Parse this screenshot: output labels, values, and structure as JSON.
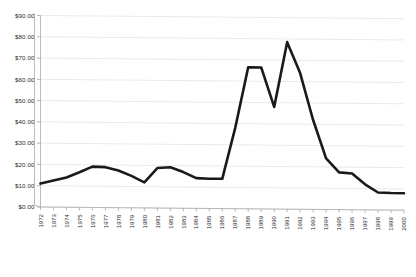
{
  "chart_data": {
    "type": "line",
    "title": "",
    "subtitle": "",
    "xlabel": "",
    "ylabel": "",
    "grid": true,
    "legend": false,
    "legend_position": "none",
    "ylim": [
      0,
      90
    ],
    "ytick_step": 10,
    "ytick_labels": [
      "$0.00",
      "$10.00",
      "$20.00",
      "$30.00",
      "$40.00",
      "$50.00",
      "$60.00",
      "$70.00",
      "$80.00",
      "$90.00"
    ],
    "ytick_values": [
      0,
      10,
      20,
      30,
      40,
      50,
      60,
      70,
      80,
      90
    ],
    "categories": [
      "1972",
      "1973",
      "1974",
      "1975",
      "1976",
      "1977",
      "1978",
      "1979",
      "1980",
      "1981",
      "1982",
      "1983",
      "1984",
      "1985",
      "1986",
      "1987",
      "1988",
      "1989",
      "1990",
      "1991",
      "1992",
      "1993",
      "1994",
      "1995",
      "1996",
      "1997",
      "1998",
      "1999",
      "2000"
    ],
    "series": [
      {
        "name": "Price",
        "color": "#1a1a1a",
        "values": [
          11.0,
          12.5,
          14.0,
          16.5,
          19.2,
          19.0,
          17.5,
          15.0,
          12.0,
          18.8,
          19.2,
          17.0,
          14.2,
          14.0,
          14.0,
          38.0,
          66.5,
          66.5,
          48.0,
          78.5,
          64.0,
          42.0,
          24.0,
          17.5,
          17.0,
          12.0,
          8.2,
          8.0,
          8.0
        ]
      }
    ],
    "colors": {
      "series": "#1a1a1a",
      "grid": "#d8d8d8",
      "axis": "#aaaaaa",
      "text": "#2b2b2b",
      "background": "#ffffff"
    }
  }
}
